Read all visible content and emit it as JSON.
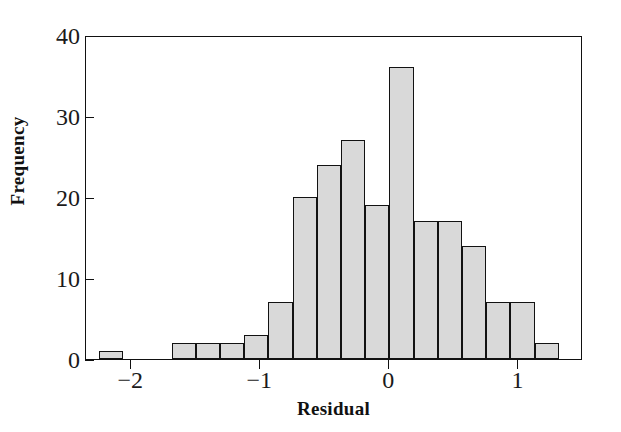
{
  "chart_data": {
    "type": "bar",
    "title": "",
    "subtitle": "",
    "xlabel": "Residual",
    "ylabel": "Frequency",
    "xlim": [
      -2.35,
      1.5
    ],
    "ylim": [
      0,
      40
    ],
    "xticks": [
      -2,
      -1,
      0,
      1
    ],
    "xtick_labels": [
      "−2",
      "−1",
      "0",
      "1"
    ],
    "yticks": [
      0,
      10,
      20,
      30,
      40
    ],
    "ytick_labels": [
      "0",
      "10",
      "20",
      "30",
      "40"
    ],
    "grid": false,
    "legend": "none",
    "bin_width": 0.1875,
    "bar_fill_color": "#d9d9d9",
    "bar_edge_color": "#121212",
    "axis_color": "#111111",
    "bins": [
      {
        "left": -2.25,
        "right": -2.0625,
        "value": 1
      },
      {
        "left": -1.6875,
        "right": -1.5,
        "value": 2
      },
      {
        "left": -1.5,
        "right": -1.3125,
        "value": 2
      },
      {
        "left": -1.3125,
        "right": -1.125,
        "value": 2
      },
      {
        "left": -1.125,
        "right": -0.9375,
        "value": 3
      },
      {
        "left": -0.9375,
        "right": -0.75,
        "value": 7
      },
      {
        "left": -0.75,
        "right": -0.5625,
        "value": 20
      },
      {
        "left": -0.5625,
        "right": -0.375,
        "value": 24
      },
      {
        "left": -0.375,
        "right": -0.1875,
        "value": 27
      },
      {
        "left": -0.1875,
        "right": 0.0,
        "value": 19
      },
      {
        "left": 0.0,
        "right": 0.1875,
        "value": 36
      },
      {
        "left": 0.1875,
        "right": 0.375,
        "value": 17
      },
      {
        "left": 0.375,
        "right": 0.5625,
        "value": 17
      },
      {
        "left": 0.5625,
        "right": 0.75,
        "value": 14
      },
      {
        "left": 0.75,
        "right": 0.9375,
        "value": 7
      },
      {
        "left": 0.9375,
        "right": 1.125,
        "value": 7
      },
      {
        "left": 1.125,
        "right": 1.3125,
        "value": 2
      }
    ],
    "categories": [
      "-2.25",
      "-1.6875",
      "-1.5",
      "-1.3125",
      "-1.125",
      "-0.9375",
      "-0.75",
      "-0.5625",
      "-0.375",
      "-0.1875",
      "0",
      "0.1875",
      "0.375",
      "0.5625",
      "0.75",
      "0.9375",
      "1.125"
    ],
    "values": [
      1,
      2,
      2,
      2,
      3,
      7,
      20,
      24,
      27,
      19,
      36,
      17,
      17,
      14,
      7,
      7,
      2
    ]
  }
}
